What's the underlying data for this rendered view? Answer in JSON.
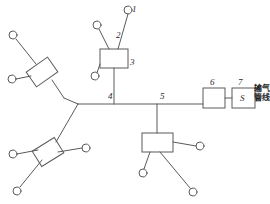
{
  "diagram": {
    "stroke_color": "#5a5a5a",
    "label_color": "#2b2b2b",
    "background": "#ffffff",
    "width": 270,
    "height": 204,
    "labels": [
      {
        "id": "1",
        "text": "1",
        "x": 132,
        "y": 5
      },
      {
        "id": "2",
        "text": "2",
        "x": 116,
        "y": 31
      },
      {
        "id": "3",
        "text": "3",
        "x": 130,
        "y": 58
      },
      {
        "id": "4",
        "text": "4",
        "x": 108,
        "y": 92
      },
      {
        "id": "5",
        "text": "5",
        "x": 160,
        "y": 92
      },
      {
        "id": "6",
        "text": "6",
        "x": 210,
        "y": 80
      },
      {
        "id": "7",
        "text": "7",
        "x": 238,
        "y": 80
      }
    ],
    "station_letter": {
      "text": "S",
      "x": 240,
      "y": 94
    },
    "pipeline_annotation": {
      "line1": "输气",
      "line2": "管线",
      "x": 254,
      "y": 85
    },
    "boxes": [
      {
        "name": "station-3",
        "x": 100,
        "y": 49,
        "w": 28,
        "h": 19
      },
      {
        "name": "station-6",
        "x": 203,
        "y": 88,
        "w": 22,
        "h": 20
      },
      {
        "name": "station-7",
        "x": 232,
        "y": 88,
        "w": 23,
        "h": 20
      },
      {
        "name": "station-center-bottom",
        "x": 142,
        "y": 133,
        "w": 31,
        "h": 19
      }
    ],
    "diamonds": [
      {
        "name": "station-upper-left",
        "cx": 42,
        "cy": 72,
        "w": 26,
        "h": 18,
        "rotate": -35
      },
      {
        "name": "station-lower-left",
        "cx": 48,
        "cy": 152,
        "w": 26,
        "h": 18,
        "rotate": -32
      }
    ],
    "wells": [
      {
        "name": "well-1",
        "cx": 128,
        "cy": 10
      },
      {
        "name": "well-2",
        "cx": 97,
        "cy": 25
      },
      {
        "name": "well-3",
        "cx": 95,
        "cy": 76
      },
      {
        "name": "well-upper-left-top",
        "cx": 13,
        "cy": 35
      },
      {
        "name": "well-upper-left-side",
        "cx": 12,
        "cy": 79
      },
      {
        "name": "well-lower-left-left",
        "cx": 13,
        "cy": 154
      },
      {
        "name": "well-lower-left-right",
        "cx": 86,
        "cy": 148
      },
      {
        "name": "well-lower-left-bottom",
        "cx": 17,
        "cy": 191
      },
      {
        "name": "well-bottom-right-upper",
        "cx": 200,
        "cy": 146
      },
      {
        "name": "well-bottom-left-lower",
        "cx": 143,
        "cy": 173
      },
      {
        "name": "well-bottom-right-lower",
        "cx": 193,
        "cy": 192
      }
    ],
    "trunk": {
      "junction_x": 78,
      "junction_y": 104,
      "main_y": 104,
      "main_end_x": 203
    }
  }
}
